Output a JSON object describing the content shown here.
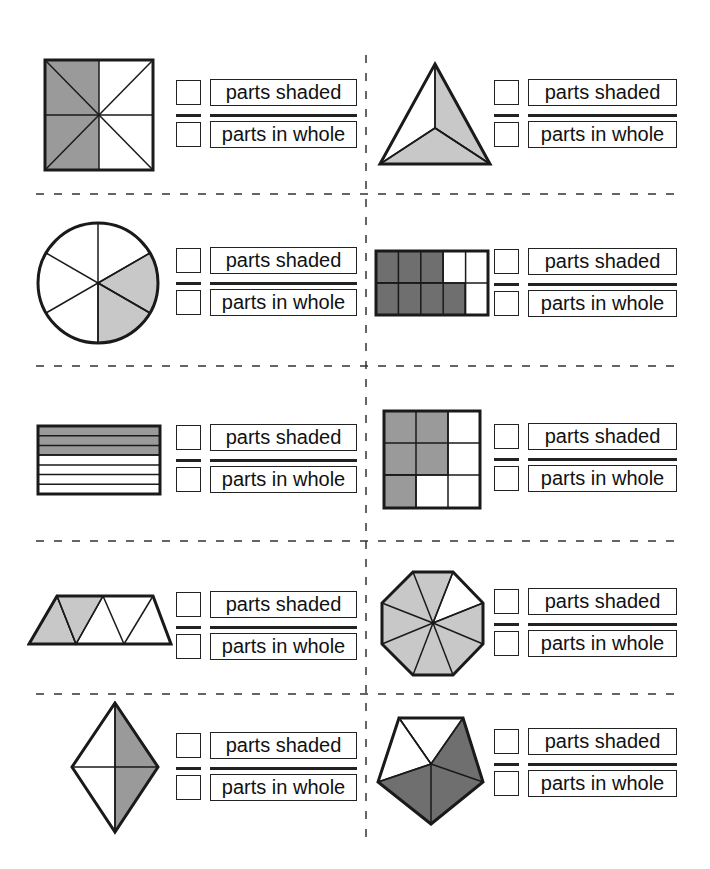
{
  "worksheet": {
    "labels": {
      "numerator": "parts shaded",
      "denominator": "parts in whole"
    },
    "colors": {
      "stroke": "#1a1a1a",
      "shade_medium": "#9a9a9a",
      "shade_light": "#c8c8c8",
      "shade_dark": "#6f6f6f",
      "dash": "#333333"
    },
    "problems": [
      {
        "id": 1,
        "shape": "square divided into 8 triangles",
        "parts_shaded": 4,
        "parts_in_whole": 8,
        "numerator_label": "parts shaded",
        "denominator_label": "parts in whole"
      },
      {
        "id": 2,
        "shape": "triangle divided into 3 parts",
        "parts_shaded": 2,
        "parts_in_whole": 3,
        "numerator_label": "parts shaded",
        "denominator_label": "parts in whole"
      },
      {
        "id": 3,
        "shape": "circle divided into 6 sectors",
        "parts_shaded": 2,
        "parts_in_whole": 6,
        "numerator_label": "parts shaded",
        "denominator_label": "parts in whole"
      },
      {
        "id": 4,
        "shape": "rectangle 2x5 grid",
        "parts_shaded": 7,
        "parts_in_whole": 10,
        "numerator_label": "parts shaded",
        "denominator_label": "parts in whole"
      },
      {
        "id": 5,
        "shape": "rectangle divided into 7 horizontal strips",
        "parts_shaded": 3,
        "parts_in_whole": 7,
        "numerator_label": "parts shaded",
        "denominator_label": "parts in whole"
      },
      {
        "id": 6,
        "shape": "square 3x3 grid",
        "parts_shaded": 5,
        "parts_in_whole": 9,
        "numerator_label": "parts shaded",
        "denominator_label": "parts in whole"
      },
      {
        "id": 7,
        "shape": "trapezoid divided into 5 triangles",
        "parts_shaded": 2,
        "parts_in_whole": 5,
        "numerator_label": "parts shaded",
        "denominator_label": "parts in whole"
      },
      {
        "id": 8,
        "shape": "octagon divided into 8 triangles",
        "parts_shaded": 7,
        "parts_in_whole": 8,
        "numerator_label": "parts shaded",
        "denominator_label": "parts in whole"
      },
      {
        "id": 9,
        "shape": "rhombus divided into 4 triangles",
        "parts_shaded": 2,
        "parts_in_whole": 4,
        "numerator_label": "parts shaded",
        "denominator_label": "parts in whole"
      },
      {
        "id": 10,
        "shape": "pentagon divided into 5 triangles",
        "parts_shaded": 3,
        "parts_in_whole": 5,
        "numerator_label": "parts shaded",
        "denominator_label": "parts in whole"
      }
    ]
  }
}
